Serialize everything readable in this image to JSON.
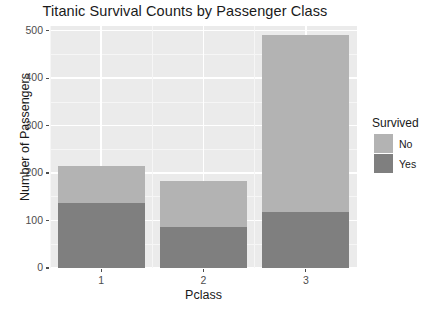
{
  "chart_data": {
    "type": "bar",
    "subtype": "stacked-bar",
    "title": "Titanic Survival Counts by Passenger Class",
    "xlabel": "Pclass",
    "ylabel": "Number of Passengers",
    "categories": [
      "1",
      "2",
      "3"
    ],
    "series": [
      {
        "name": "Yes",
        "values": [
          136,
          87,
          119
        ],
        "color": "#7f7f7f"
      },
      {
        "name": "No",
        "values": [
          80,
          97,
          372
        ],
        "color": "#b3b3b3"
      }
    ],
    "stack_order_bottom_to_top": [
      "Yes",
      "No"
    ],
    "totals": [
      216,
      184,
      491
    ],
    "ylim": [
      0,
      510
    ],
    "yticks": [
      0,
      100,
      200,
      300,
      400,
      500
    ],
    "ytick_labels": [
      "0",
      "100",
      "200",
      "300",
      "400",
      "500"
    ],
    "xtick_labels": [
      "1",
      "2",
      "3"
    ],
    "grid": true,
    "grid_minor": true,
    "legend": {
      "title": "Survived",
      "position": "right",
      "entries": [
        {
          "label": "No",
          "color": "#b3b3b3"
        },
        {
          "label": "Yes",
          "color": "#7f7f7f"
        }
      ]
    },
    "panel_background": "#ebebeb",
    "gridline_color": "#ffffff"
  }
}
